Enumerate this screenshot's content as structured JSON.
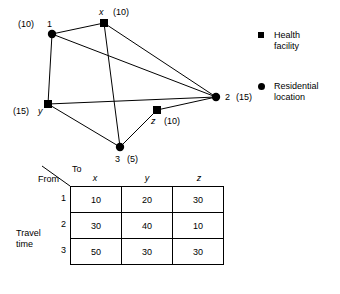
{
  "figure": {
    "network": {
      "nodes": [
        {
          "id": "1",
          "type": "residential",
          "label": "1",
          "weight": "(10)",
          "x": 52,
          "y": 34,
          "label_text": "(10)  1"
        },
        {
          "id": "x",
          "type": "health",
          "label": "x",
          "weight": "(10)",
          "x": 104,
          "y": 23
        },
        {
          "id": "2",
          "type": "residential",
          "label": "2",
          "weight": "(15)",
          "x": 216,
          "y": 97
        },
        {
          "id": "y",
          "type": "health",
          "label": "y",
          "weight": "(15)",
          "x": 48,
          "y": 104
        },
        {
          "id": "z",
          "type": "health",
          "label": "z",
          "weight": "(10)",
          "x": 157,
          "y": 110
        },
        {
          "id": "3",
          "type": "residential",
          "label": "3",
          "weight": "(5)",
          "x": 120,
          "y": 147
        }
      ],
      "edges": [
        {
          "from": "1",
          "to": "x"
        },
        {
          "from": "1",
          "to": "y"
        },
        {
          "from": "1",
          "to": "2"
        },
        {
          "from": "x",
          "to": "2"
        },
        {
          "from": "x",
          "to": "3"
        },
        {
          "from": "y",
          "to": "2"
        },
        {
          "from": "y",
          "to": "3"
        },
        {
          "from": "3",
          "to": "z"
        },
        {
          "from": "z",
          "to": "2"
        }
      ],
      "labels": {
        "node1_weight": "(10)",
        "node1_name": "1",
        "nodex_name": "x",
        "nodex_weight": "(10)",
        "node2_name": "2",
        "node2_weight": "(15)",
        "nodey_weight": "(15)",
        "nodey_name": "y",
        "nodez_name": "z",
        "nodez_weight": "(10)",
        "node3_name": "3",
        "node3_weight": "(5)"
      }
    },
    "legend": {
      "items": [
        {
          "marker": "square-marker-icon",
          "text": "Health\nfacility",
          "line1": "Health",
          "line2": "facility"
        },
        {
          "marker": "circle-marker-icon",
          "text": "Residential\nlocation",
          "line1": "Residential",
          "line2": "location"
        }
      ]
    },
    "matrix": {
      "caption": "Travel\ntime",
      "corner_to": "To",
      "corner_from": "From",
      "columns": [
        "x",
        "y",
        "z"
      ],
      "rows": [
        {
          "label": "1",
          "values": [
            "10",
            "20",
            "30"
          ]
        },
        {
          "label": "2",
          "values": [
            "30",
            "40",
            "10"
          ]
        },
        {
          "label": "3",
          "values": [
            "50",
            "30",
            "30"
          ]
        }
      ]
    }
  },
  "colors": {
    "ink": "#000000",
    "paper": "#ffffff"
  }
}
